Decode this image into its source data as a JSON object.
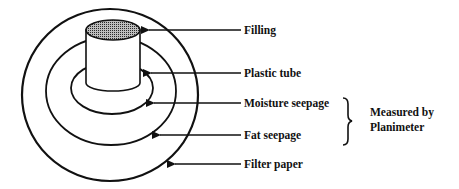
{
  "figure": {
    "labels": {
      "filling": "Filling",
      "plastic_tube": "Plastic tube",
      "moisture_seepage": "Moisture seepage",
      "fat_seepage": "Fat seepage",
      "filter_paper": "Filter paper"
    },
    "bracket_note": {
      "line1": "Measured by",
      "line2": "Planimeter"
    }
  },
  "colors": {
    "stroke": "#111111",
    "filling_fill": "#7a7a7a",
    "background": "#ffffff"
  }
}
